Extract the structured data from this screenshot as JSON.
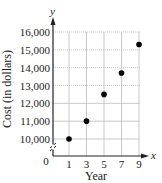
{
  "chart_data": {
    "type": "scatter",
    "title": "",
    "xlabel": "Year",
    "ylabel": "Cost (in dollars)",
    "x_axis_var": "x",
    "y_axis_var": "y",
    "origin_label": "0",
    "x": [
      1,
      3,
      5,
      7,
      9
    ],
    "y": [
      10000,
      11000,
      12500,
      13700,
      15300
    ],
    "series": [
      {
        "name": "Cost",
        "x": [
          1,
          3,
          5,
          7,
          9
        ],
        "values": [
          10000,
          11000,
          12500,
          13700,
          15300
        ]
      }
    ],
    "x_ticks": [
      "1",
      "3",
      "5",
      "7",
      "9"
    ],
    "y_ticks": [
      "10,000",
      "11,000",
      "12,000",
      "13,000",
      "14,000",
      "15,000",
      "16,000"
    ],
    "xlim": [
      0,
      9
    ],
    "ylim": [
      10000,
      16000
    ],
    "y_axis_break": true,
    "grid": true,
    "legend": "none",
    "colors": {
      "points": "#000000",
      "grid": "#bbbbbb",
      "axis": "#222222"
    }
  }
}
